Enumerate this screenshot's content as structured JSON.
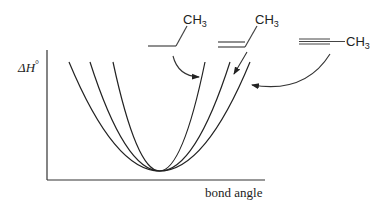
{
  "diagram": {
    "type": "energy-vs-bond-angle",
    "axes": {
      "ylabel": "ΔH°",
      "xlabel": "bond angle"
    },
    "molecules": [
      {
        "id": "alkane",
        "bond": "single",
        "substituent": "CH3",
        "curve": "inner",
        "label": "CH3"
      },
      {
        "id": "alkene",
        "bond": "double",
        "substituent": "CH3",
        "curve": "middle",
        "label": "CH3"
      },
      {
        "id": "alkyne",
        "bond": "triple",
        "substituent": "CH3",
        "curve": "outer",
        "label": "CH3"
      }
    ],
    "curves": [
      {
        "name": "inner",
        "shape": "parabola",
        "width": "narrow"
      },
      {
        "name": "middle",
        "shape": "parabola",
        "width": "medium"
      },
      {
        "name": "outer",
        "shape": "parabola",
        "width": "wide"
      }
    ],
    "colors": {
      "ink": "#222222",
      "background": "#ffffff"
    }
  }
}
